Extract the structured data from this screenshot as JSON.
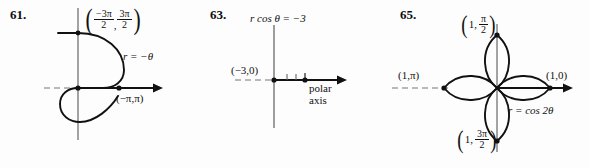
{
  "page": {
    "width": 590,
    "height": 168,
    "background": "#fdfdfd",
    "ink": "#111111"
  },
  "figures": [
    {
      "number": "61.",
      "equation": "r = −θ",
      "point_labels": [
        {
          "text": "(−3π/2, 3π/2)",
          "num1": "−3π",
          "den1": "2",
          "num2": "3π",
          "den2": "2"
        },
        {
          "text": "(−π,π)"
        }
      ],
      "axis_style": "polar-axis-with-dashed-negative-x",
      "curve": "spiral r = -theta"
    },
    {
      "number": "63.",
      "equation": "r cos θ  =  −3",
      "point_labels": [
        {
          "text": "(−3,0)"
        }
      ],
      "axis_label": "polar\naxis",
      "axis_label_line1": "polar",
      "axis_label_line2": "axis",
      "axis_style": "polar-axis-with-dashed-negative-x-and-ticks",
      "curve": "vertical line x = -3"
    },
    {
      "number": "65.",
      "equation": "r  =  cos 2θ",
      "point_labels": [
        {
          "text": "(1, π/2)",
          "lead": "1,",
          "num": "π",
          "den": "2"
        },
        {
          "text": "(1,π)"
        },
        {
          "text": "(1,0)"
        },
        {
          "text": "(1, 3π/2)",
          "lead": "1,",
          "num": "3π",
          "den": "2"
        }
      ],
      "axis_style": "polar-axis-with-dashed-negative-x",
      "curve": "four-petal rose r = cos 2theta"
    }
  ]
}
